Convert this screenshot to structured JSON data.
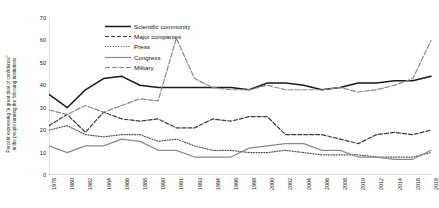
{
  "chart_data": {
    "type": "line",
    "title": "",
    "xlabel": "",
    "ylabel": "Percent expressing \"a great deal of confidence\" in the people running the following institutions",
    "ylabel_line1": "Percent expressing \"a great deal of confidence\"",
    "ylabel_line2": "in the people running the following institutions",
    "ylim": [
      0,
      70
    ],
    "yticks": [
      0,
      10,
      20,
      30,
      40,
      50,
      60,
      70
    ],
    "grid": false,
    "legend_position": "top-left-inside",
    "x": [
      "1978",
      "1980",
      "1982",
      "1984",
      "1986",
      "1988",
      "1990",
      "1991",
      "1993",
      "1994",
      "1996",
      "1998",
      "2000",
      "2002",
      "2004",
      "2006",
      "2008",
      "2010",
      "2012",
      "2014",
      "2016",
      "2018"
    ],
    "categories": [
      "1978",
      "1980",
      "1982",
      "1984",
      "1986",
      "1988",
      "1990",
      "1991",
      "1993",
      "1994",
      "1996",
      "1998",
      "2000",
      "2002",
      "2004",
      "2006",
      "2008",
      "2010",
      "2012",
      "2014",
      "2016",
      "2018"
    ],
    "series": [
      {
        "name": "Scientific community",
        "color": "#1a1a1a",
        "style": "solid",
        "values": [
          36,
          30,
          38,
          43,
          44,
          40,
          39,
          39,
          39,
          39,
          39,
          38,
          41,
          41,
          40,
          38,
          39,
          41,
          41,
          42,
          42,
          44
        ]
      },
      {
        "name": "Major companies",
        "color": "#3b3b3b",
        "style": "dashed",
        "values": [
          22,
          27,
          19,
          28,
          25,
          24,
          25,
          21,
          21,
          25,
          24,
          26,
          26,
          18,
          18,
          18,
          16,
          14,
          18,
          19,
          18,
          20
        ]
      },
      {
        "name": "Press",
        "color": "#555555",
        "style": "dotted",
        "values": [
          20,
          22,
          18,
          17,
          18,
          18,
          15,
          16,
          13,
          11,
          11,
          10,
          10,
          11,
          10,
          9,
          9,
          9,
          8,
          8,
          8,
          10
        ]
      },
      {
        "name": "Congress",
        "color": "#8a8a8a",
        "style": "solid-light",
        "values": [
          13,
          10,
          13,
          13,
          16,
          15,
          11,
          11,
          8,
          8,
          8,
          12,
          13,
          14,
          14,
          11,
          11,
          8,
          8,
          7,
          7,
          11
        ]
      },
      {
        "name": "Military",
        "color": "#8a8a8a",
        "style": "dashdot",
        "values": [
          29,
          27,
          31,
          28,
          31,
          34,
          33,
          61,
          43,
          39,
          38,
          38,
          40,
          38,
          38,
          38,
          39,
          37,
          38,
          40,
          43,
          60
        ]
      }
    ]
  },
  "legend": {
    "items": [
      {
        "label": "Scientific community"
      },
      {
        "label": "Major companies"
      },
      {
        "label": "Press"
      },
      {
        "label": "Congress"
      },
      {
        "label": "Military"
      }
    ]
  }
}
